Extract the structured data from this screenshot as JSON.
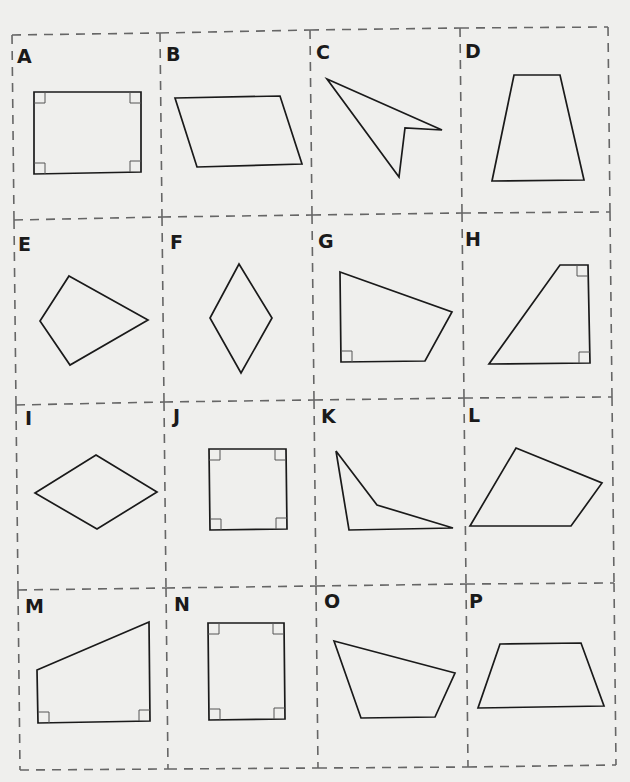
{
  "page": {
    "background": "#efefed",
    "line_color": "#1a1a1a",
    "dash_color": "#666666"
  },
  "grid": {
    "rows": 4,
    "cols": 4,
    "row_lines": [
      [
        [
          12,
          35
        ],
        [
          160,
          33
        ],
        [
          310,
          30
        ],
        [
          460,
          28
        ],
        [
          608,
          27
        ]
      ],
      [
        [
          14,
          220
        ],
        [
          162,
          217
        ],
        [
          312,
          215
        ],
        [
          462,
          213
        ],
        [
          610,
          212
        ]
      ],
      [
        [
          16,
          405
        ],
        [
          164,
          402
        ],
        [
          314,
          400
        ],
        [
          464,
          398
        ],
        [
          612,
          397
        ]
      ],
      [
        [
          18,
          590
        ],
        [
          166,
          588
        ],
        [
          316,
          586
        ],
        [
          466,
          584
        ],
        [
          614,
          583
        ]
      ],
      [
        [
          20,
          770
        ],
        [
          168,
          769
        ],
        [
          318,
          768
        ],
        [
          468,
          767
        ],
        [
          616,
          765
        ]
      ]
    ]
  },
  "cells": [
    {
      "label": "A",
      "label_pos": [
        17,
        62
      ],
      "shape": "rectangle",
      "points": [
        [
          34,
          92
        ],
        [
          141,
          92
        ],
        [
          141,
          172
        ],
        [
          34,
          174
        ]
      ],
      "right_angles": [
        [
          34,
          92,
          1,
          1
        ],
        [
          141,
          92,
          -1,
          1
        ],
        [
          141,
          172,
          -1,
          -1
        ],
        [
          34,
          174,
          1,
          -1
        ]
      ]
    },
    {
      "label": "B",
      "label_pos": [
        166,
        60
      ],
      "shape": "parallelogram",
      "points": [
        [
          175,
          98
        ],
        [
          280,
          96
        ],
        [
          302,
          164
        ],
        [
          197,
          167
        ]
      ],
      "right_angles": []
    },
    {
      "label": "C",
      "label_pos": [
        316,
        58
      ],
      "shape": "arrowhead",
      "points": [
        [
          327,
          79
        ],
        [
          442,
          130
        ],
        [
          405,
          128
        ],
        [
          399,
          177
        ]
      ],
      "right_angles": []
    },
    {
      "label": "D",
      "label_pos": [
        465,
        57
      ],
      "shape": "trapezoid",
      "points": [
        [
          514,
          75
        ],
        [
          560,
          75
        ],
        [
          584,
          180
        ],
        [
          492,
          181
        ]
      ],
      "right_angles": []
    },
    {
      "label": "E",
      "label_pos": [
        18,
        250
      ],
      "shape": "kite",
      "points": [
        [
          69,
          276
        ],
        [
          148,
          320
        ],
        [
          70,
          365
        ],
        [
          40,
          321
        ]
      ],
      "right_angles": []
    },
    {
      "label": "F",
      "label_pos": [
        170,
        248
      ],
      "shape": "rhombus",
      "points": [
        [
          239,
          264
        ],
        [
          272,
          318
        ],
        [
          241,
          373
        ],
        [
          210,
          318
        ]
      ],
      "right_angles": []
    },
    {
      "label": "G",
      "label_pos": [
        318,
        247
      ],
      "shape": "quadrilateral",
      "points": [
        [
          340,
          272
        ],
        [
          452,
          312
        ],
        [
          425,
          361
        ],
        [
          341,
          362
        ]
      ],
      "right_angles": [
        [
          341,
          362,
          1,
          -1
        ]
      ]
    },
    {
      "label": "H",
      "label_pos": [
        465,
        245
      ],
      "shape": "right-trapezoid",
      "points": [
        [
          560,
          265
        ],
        [
          588,
          265
        ],
        [
          590,
          363
        ],
        [
          489,
          364
        ]
      ],
      "right_angles": [
        [
          588,
          265,
          -1,
          1
        ],
        [
          590,
          363,
          -1,
          -1
        ]
      ]
    },
    {
      "label": "I",
      "label_pos": [
        25,
        424
      ],
      "shape": "rhombus",
      "points": [
        [
          96,
          455
        ],
        [
          157,
          492
        ],
        [
          97,
          529
        ],
        [
          35,
          493
        ]
      ],
      "right_angles": []
    },
    {
      "label": "J",
      "label_pos": [
        173,
        422
      ],
      "shape": "square",
      "points": [
        [
          209,
          449
        ],
        [
          286,
          449
        ],
        [
          287,
          529
        ],
        [
          210,
          530
        ]
      ],
      "right_angles": [
        [
          209,
          449,
          1,
          1
        ],
        [
          286,
          449,
          -1,
          1
        ],
        [
          287,
          529,
          -1,
          -1
        ],
        [
          210,
          530,
          1,
          -1
        ]
      ]
    },
    {
      "label": "K",
      "label_pos": [
        321,
        422
      ],
      "shape": "concave-quadrilateral",
      "points": [
        [
          336,
          451
        ],
        [
          377,
          505
        ],
        [
          453,
          528
        ],
        [
          349,
          530
        ]
      ],
      "right_angles": []
    },
    {
      "label": "L",
      "label_pos": [
        468,
        421
      ],
      "shape": "quadrilateral",
      "points": [
        [
          516,
          448
        ],
        [
          602,
          483
        ],
        [
          571,
          526
        ],
        [
          470,
          526
        ]
      ],
      "right_angles": []
    },
    {
      "label": "M",
      "label_pos": [
        25,
        612
      ],
      "shape": "right-trapezoid",
      "points": [
        [
          37,
          670
        ],
        [
          149,
          622
        ],
        [
          150,
          721
        ],
        [
          38,
          723
        ]
      ],
      "right_angles": [
        [
          38,
          723,
          1,
          -1
        ],
        [
          150,
          721,
          -1,
          -1
        ]
      ]
    },
    {
      "label": "N",
      "label_pos": [
        174,
        610
      ],
      "shape": "rectangle",
      "points": [
        [
          208,
          623
        ],
        [
          284,
          623
        ],
        [
          285,
          719
        ],
        [
          209,
          720
        ]
      ],
      "right_angles": [
        [
          208,
          623,
          1,
          1
        ],
        [
          284,
          623,
          -1,
          1
        ],
        [
          285,
          719,
          -1,
          -1
        ],
        [
          209,
          720,
          1,
          -1
        ]
      ]
    },
    {
      "label": "O",
      "label_pos": [
        324,
        607
      ],
      "shape": "quadrilateral",
      "points": [
        [
          334,
          641
        ],
        [
          455,
          673
        ],
        [
          435,
          717
        ],
        [
          361,
          718
        ]
      ],
      "right_angles": []
    },
    {
      "label": "P",
      "label_pos": [
        469,
        607
      ],
      "shape": "trapezoid",
      "points": [
        [
          500,
          644
        ],
        [
          581,
          643
        ],
        [
          604,
          706
        ],
        [
          478,
          708
        ]
      ],
      "right_angles": []
    }
  ]
}
